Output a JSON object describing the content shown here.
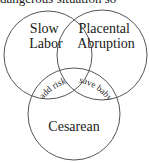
{
  "caption": {
    "partial_text": "dangerous situation so"
  },
  "diagram": {
    "type": "venn",
    "circles": [
      {
        "id": "slow-labor",
        "lines": [
          "Slow",
          "Labor"
        ]
      },
      {
        "id": "placental-abruption",
        "lines": [
          "Placental",
          "Abruption"
        ]
      },
      {
        "id": "cesarean",
        "lines": [
          "Cesarean"
        ]
      }
    ],
    "intersections": [
      {
        "sets": [
          "slow-labor",
          "cesarean"
        ],
        "label": "add risk"
      },
      {
        "sets": [
          "placental-abruption",
          "cesarean"
        ],
        "label": "save baby"
      }
    ],
    "stroke_color": "#555555"
  }
}
